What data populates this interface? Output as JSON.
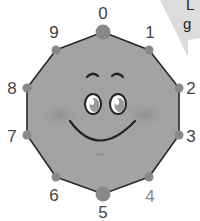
{
  "diagram": {
    "type": "decagon-face",
    "fill_color": "#a3a3a3",
    "edge_color": "#2a2a2a",
    "dot_color": "#888888",
    "vertices": [
      {
        "label": "0",
        "x": 103,
        "y": 32,
        "lx": 103,
        "ly": 13,
        "big": true
      },
      {
        "label": "1",
        "x": 149,
        "y": 50,
        "lx": 150,
        "ly": 32,
        "big": false
      },
      {
        "label": "2",
        "x": 179,
        "y": 88,
        "lx": 191,
        "ly": 88,
        "big": false
      },
      {
        "label": "3",
        "x": 179,
        "y": 135,
        "lx": 191,
        "ly": 136,
        "big": false
      },
      {
        "label": "4",
        "x": 149,
        "y": 177,
        "lx": 150,
        "ly": 196,
        "big": false
      },
      {
        "label": "5",
        "x": 103,
        "y": 194,
        "lx": 103,
        "ly": 212,
        "big": true
      },
      {
        "label": "6",
        "x": 56,
        "y": 177,
        "lx": 54,
        "ly": 195,
        "big": false
      },
      {
        "label": "7",
        "x": 27,
        "y": 135,
        "lx": 12,
        "ly": 136,
        "big": false
      },
      {
        "label": "8",
        "x": 27,
        "y": 88,
        "lx": 12,
        "ly": 88,
        "big": false
      },
      {
        "label": "9",
        "x": 56,
        "y": 50,
        "lx": 54,
        "ly": 32,
        "big": false
      }
    ]
  },
  "speech_bubble": {
    "line1": "L",
    "line2": "g"
  }
}
